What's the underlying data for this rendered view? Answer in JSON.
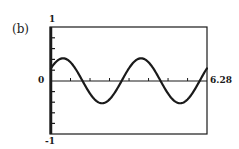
{
  "panel": {
    "label": "(b)"
  },
  "axes": {
    "y_top_label": "1",
    "y_zero_label": "0",
    "y_bottom_label": "-1",
    "x_max_label": "6.28"
  },
  "colors": {
    "line": "#1a1a1a",
    "frame": "#1a1a1a",
    "background": "#ffffff"
  },
  "chart_data": {
    "type": "line",
    "title": "(b)",
    "xlabel": "",
    "ylabel": "",
    "xlim": [
      0,
      6.28
    ],
    "ylim": [
      -1,
      1
    ],
    "grid": false,
    "legend": null,
    "x_tick_labels": [
      "6.28"
    ],
    "y_tick_labels": [
      "1",
      "0",
      "-1"
    ],
    "x_ticks": [
      0.785,
      1.571,
      2.356,
      3.142,
      3.927,
      4.712,
      5.498
    ],
    "y_ticks": [
      -0.8,
      -0.6,
      -0.4,
      -0.2,
      0.2,
      0.4,
      0.6,
      0.8
    ],
    "series": [
      {
        "name": "y = 0.4 sin(2x + 0.6)",
        "x": [
          0,
          0.39,
          0.79,
          1.18,
          1.57,
          1.96,
          2.36,
          2.75,
          3.14,
          3.53,
          3.93,
          4.32,
          4.71,
          5.11,
          5.5,
          5.89,
          6.28
        ],
        "values": [
          0.23,
          0.38,
          0.33,
          0.14,
          -0.07,
          -0.33,
          -0.38,
          -0.23,
          0.23,
          0.38,
          0.33,
          0.14,
          -0.07,
          -0.33,
          -0.38,
          -0.23,
          0.23
        ]
      }
    ]
  }
}
